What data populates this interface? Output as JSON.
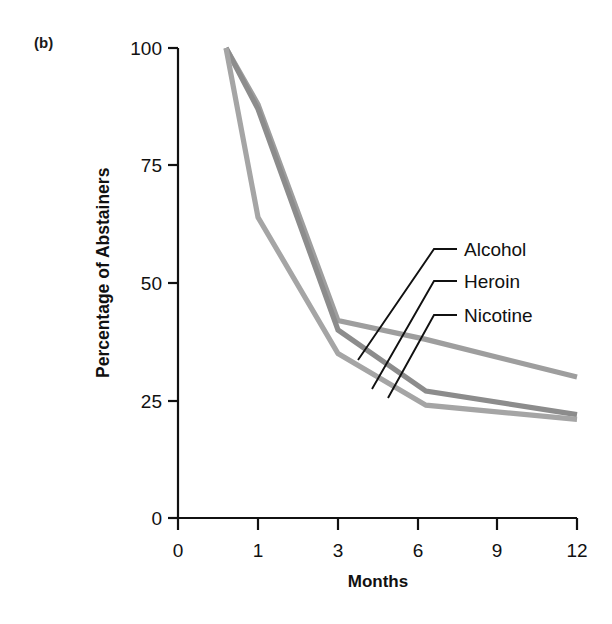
{
  "figure": {
    "panel_label": "(b)",
    "xlabel": "Months",
    "ylabel": "Percentage of Abstainers"
  },
  "axis": {
    "y_ticks": [
      "0",
      "25",
      "50",
      "75",
      "100"
    ],
    "x_ticks": [
      "0",
      "1",
      "3",
      "6",
      "9",
      "12"
    ]
  },
  "series_labels": {
    "alcohol": "Alcohol",
    "heroin": "Heroin",
    "nicotine": "Nicotine"
  },
  "colors": {
    "line": "#9e9e9e",
    "line_dark": "#8c8c8c",
    "axis": "#111111",
    "leader": "#111111",
    "background": "#ffffff"
  },
  "chart_data": {
    "type": "line",
    "title": "",
    "subtitle": "",
    "xlabel": "Months",
    "ylabel": "Percentage of Abstainers",
    "x": [
      0.6,
      1,
      3,
      6.3,
      12
    ],
    "x_tick_labels": [
      "0",
      "1",
      "3",
      "6",
      "9",
      "12"
    ],
    "x_tick_values": [
      0,
      1,
      3,
      6,
      9,
      12
    ],
    "y_tick_labels": [
      "0",
      "25",
      "50",
      "75",
      "100"
    ],
    "y_tick_values": [
      0,
      25,
      50,
      75,
      100
    ],
    "ylim": [
      0,
      100
    ],
    "grid": false,
    "legend_position": "inline-leader-labels",
    "series": [
      {
        "name": "Alcohol",
        "values": [
          100,
          88,
          42,
          38,
          30
        ],
        "color": "#9e9e9e"
      },
      {
        "name": "Heroin",
        "values": [
          100,
          87,
          40,
          27,
          22
        ],
        "color": "#8c8c8c"
      },
      {
        "name": "Nicotine",
        "values": [
          100,
          64,
          35,
          24,
          21
        ],
        "color": "#a5a5a5"
      }
    ],
    "annotations": [
      {
        "text": "Alcohol",
        "x": 6.2,
        "y": 54
      },
      {
        "text": "Heroin",
        "x": 6.2,
        "y": 47
      },
      {
        "text": "Nicotine",
        "x": 6.2,
        "y": 40
      }
    ]
  }
}
